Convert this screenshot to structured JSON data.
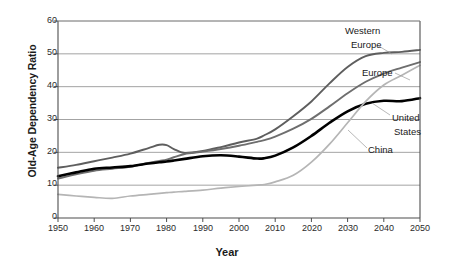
{
  "chart_data": {
    "type": "line",
    "title": "",
    "xlabel": "Year",
    "ylabel": "Old-Age Dependency Ratio",
    "xlim": [
      1950,
      2050
    ],
    "ylim": [
      0,
      60
    ],
    "xticks": [
      1950,
      1960,
      1970,
      1980,
      1990,
      2000,
      2010,
      2020,
      2030,
      2040,
      2050
    ],
    "yticks": [
      0,
      10,
      20,
      30,
      40,
      50,
      60
    ],
    "grid": "horizontal",
    "legend_position": "inline-annotations",
    "x": [
      1950,
      1955,
      1960,
      1965,
      1970,
      1975,
      1978,
      1980,
      1982,
      1985,
      1990,
      1995,
      2000,
      2005,
      2007,
      2010,
      2015,
      2020,
      2025,
      2030,
      2035,
      2040,
      2045,
      2050
    ],
    "series": [
      {
        "name": "Western Europe",
        "color": "#5e5e5e",
        "width": 1.9,
        "values": [
          15.3,
          16.2,
          17.3,
          18.4,
          19.6,
          21.3,
          22.3,
          22.2,
          21.0,
          19.8,
          20.4,
          21.6,
          23.0,
          24.2,
          25.2,
          27.0,
          31.0,
          35.5,
          41.0,
          46.0,
          49.3,
          50.3,
          50.6,
          51.2
        ]
      },
      {
        "name": "Europe",
        "color": "#6e6e6e",
        "width": 1.9,
        "values": [
          12.0,
          13.3,
          14.4,
          15.0,
          15.6,
          16.8,
          17.4,
          17.8,
          18.5,
          19.5,
          20.2,
          21.0,
          22.0,
          23.2,
          23.7,
          24.8,
          27.2,
          30.2,
          34.0,
          38.0,
          41.5,
          44.0,
          45.8,
          47.5
        ]
      },
      {
        "name": "United States",
        "color": "#000000",
        "width": 2.6,
        "values": [
          12.7,
          13.9,
          15.0,
          15.4,
          15.8,
          16.6,
          17.0,
          17.2,
          17.5,
          18.0,
          18.8,
          19.1,
          18.7,
          18.1,
          18.2,
          19.0,
          21.5,
          25.0,
          29.0,
          32.5,
          34.8,
          35.7,
          35.6,
          36.5
        ]
      },
      {
        "name": "China",
        "color": "#b5b5b5",
        "width": 1.7,
        "values": [
          7.2,
          6.7,
          6.3,
          6.0,
          6.7,
          7.2,
          7.5,
          7.7,
          7.9,
          8.1,
          8.5,
          9.1,
          9.6,
          10.0,
          10.2,
          11.0,
          13.0,
          17.0,
          22.5,
          29.0,
          35.5,
          40.5,
          43.5,
          46.5
        ]
      }
    ],
    "annotations": [
      {
        "text": "Western",
        "series": "Western Europe"
      },
      {
        "text": "Europe",
        "series": "Western Europe"
      },
      {
        "text": "Europe",
        "series": "Europe"
      },
      {
        "text": "United",
        "series": "United States"
      },
      {
        "text": "States",
        "series": "United States"
      },
      {
        "text": "China",
        "series": "China"
      }
    ]
  },
  "labels": {
    "western_europe_1": "Western",
    "western_europe_2": "Europe",
    "europe": "Europe",
    "united_states_1": "United",
    "united_states_2": "States",
    "china": "China"
  },
  "axis": {
    "y_title": "Old-Age Dependency Ratio",
    "x_title": "Year",
    "y_0": "0",
    "y_10": "10",
    "y_20": "20",
    "y_30": "30",
    "y_40": "40",
    "y_50": "50",
    "y_60": "60",
    "x_1950": "1950",
    "x_1960": "1960",
    "x_1970": "1970",
    "x_1980": "1980",
    "x_1990": "1990",
    "x_2000": "2000",
    "x_2010": "2010",
    "x_2020": "2020",
    "x_2030": "2030",
    "x_2040": "2040",
    "x_2050": "2050"
  },
  "colors": {
    "western_europe": "#5e5e5e",
    "europe": "#6e6e6e",
    "united_states": "#000000",
    "china": "#b5b5b5",
    "grid": "#8c8c8c",
    "axis": "#4d4d4d"
  }
}
